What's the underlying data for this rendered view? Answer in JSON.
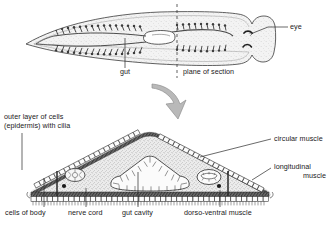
{
  "figure": {
    "background_color": "#ffffff",
    "ink_color": "#1a1a1a",
    "tissue_fill": "#e8e8e8",
    "stipple_color": "#7a7a7a",
    "muscle_color": "#4a4a4a",
    "panels": [
      {
        "id": "whole-body",
        "name": "dorsal view of flatworm",
        "labels": [
          {
            "key": "eye",
            "text": "eye"
          },
          {
            "key": "gut",
            "text": "gut"
          },
          {
            "key": "plane_of_section",
            "text": "plane of section"
          }
        ]
      },
      {
        "id": "transverse-section",
        "name": "transverse section through body",
        "labels": [
          {
            "key": "epidermis",
            "text": "outer layer of cells\n(epidermis) with cilia"
          },
          {
            "key": "circular_muscle",
            "text": "circular muscle"
          },
          {
            "key": "longitudinal_muscle",
            "text": "longitudinal\nmuscle"
          },
          {
            "key": "cells_of_body",
            "text": "cells of body"
          },
          {
            "key": "nerve_cord",
            "text": "nerve cord"
          },
          {
            "key": "gut_cavity",
            "text": "gut cavity"
          },
          {
            "key": "dorso_ventral_muscle",
            "text": "dorso-ventral muscle"
          }
        ]
      }
    ]
  },
  "labels": {
    "eye": "eye",
    "gut": "gut",
    "plane_of_section": "plane of section",
    "epidermis_line1": "outer layer of cells",
    "epidermis_line2": "(epidermis) with cilia",
    "circular_muscle": "circular muscle",
    "longitudinal_line1": "longitudinal",
    "longitudinal_line2": "muscle",
    "cells_of_body": "cells of body",
    "nerve_cord": "nerve cord",
    "gut_cavity": "gut cavity",
    "dorso_ventral_muscle": "dorso-ventral muscle"
  }
}
